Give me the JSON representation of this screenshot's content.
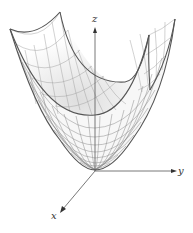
{
  "figure": {
    "axes": {
      "x_label": "x",
      "y_label": "y",
      "z_label": "z"
    },
    "colors": {
      "background": "#ffffff",
      "axis": "#555555",
      "outline": "#555555",
      "mesh": "#8a8a8a",
      "shade": "#d8d8d8",
      "label": "#333333"
    }
  }
}
